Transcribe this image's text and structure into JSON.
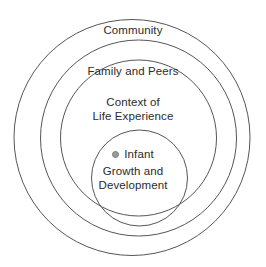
{
  "diagram": {
    "background_color": "#ffffff",
    "stroke_color": "#555555",
    "text_color": "#2b2b2b",
    "bullet_color": "#9a9a9a",
    "center": {
      "x": 139,
      "y": 138
    },
    "rings": [
      {
        "id": "community",
        "label": "Community",
        "radius": 125,
        "level": 4
      },
      {
        "id": "family-and-peers",
        "label": "Family and Peers",
        "radius": 98,
        "level": 3
      },
      {
        "id": "context-of-life-experience",
        "label_line1": "Context of",
        "label_line2": "Life Experience",
        "radius": 78,
        "level": 2
      },
      {
        "id": "infant-growth-and-development",
        "bullet_label": "Infant",
        "label_line1": "Growth and",
        "label_line2": "Development",
        "radius": 48,
        "level": 1
      }
    ]
  }
}
